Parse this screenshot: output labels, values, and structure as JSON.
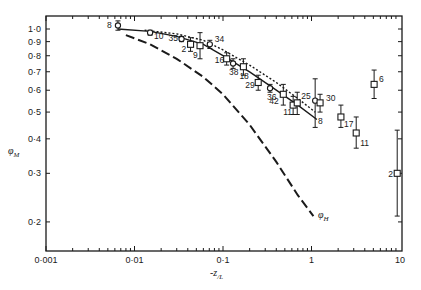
{
  "chart_data": {
    "type": "scatter",
    "title": "",
    "xlabel": "-z/L",
    "ylabel": "φM",
    "xscale": "log",
    "yscale": "log",
    "xlim": [
      0.001,
      10
    ],
    "ylim": [
      0.15,
      1.1
    ],
    "grid": false,
    "x_ticks": [
      0.001,
      0.01,
      0.1,
      1,
      10
    ],
    "x_tick_labels": [
      "0·001",
      "0·01",
      "0·1",
      "1",
      "10"
    ],
    "y_ticks": [
      1.0,
      0.9,
      0.8,
      0.7,
      0.6,
      0.5,
      0.4,
      0.3,
      0.2
    ],
    "y_tick_labels": [
      "1·0",
      "0·9",
      "0·8",
      "0·7",
      "0·6",
      "0·5",
      "0·4",
      "0·3",
      "0·2"
    ],
    "series": [
      {
        "name": "observations (circles)",
        "marker": "circle",
        "points": [
          {
            "x": 0.0065,
            "y": 1.03,
            "label": "8",
            "err": [
              0.99,
              1.07
            ]
          },
          {
            "x": 0.015,
            "y": 0.97,
            "label": "10",
            "err": [
              0.95,
              0.99
            ]
          },
          {
            "x": 0.034,
            "y": 0.92,
            "label": "35",
            "err": [
              0.9,
              0.94
            ]
          },
          {
            "x": 0.071,
            "y": 0.88,
            "label": "34",
            "err": [
              0.85,
              0.91
            ]
          },
          {
            "x": 0.13,
            "y": 0.75,
            "label": "38",
            "err": [
              0.72,
              0.78
            ]
          },
          {
            "x": 0.34,
            "y": 0.61,
            "label": "36",
            "err": [
              0.59,
              0.63
            ]
          },
          {
            "x": 1.1,
            "y": 0.55,
            "label": "",
            "err": [
              0.44,
              0.66
            ]
          }
        ]
      },
      {
        "name": "observations (squares)",
        "marker": "square",
        "points": [
          {
            "x": 0.043,
            "y": 0.88,
            "label": "2",
            "err": [
              0.83,
              0.93
            ]
          },
          {
            "x": 0.055,
            "y": 0.87,
            "label": "9",
            "err": [
              0.78,
              0.97
            ]
          },
          {
            "x": 0.11,
            "y": 0.78,
            "label": "16",
            "err": [
              0.74,
              0.82
            ]
          },
          {
            "x": 0.17,
            "y": 0.73,
            "label": "18",
            "err": [
              0.68,
              0.78
            ]
          },
          {
            "x": 0.25,
            "y": 0.64,
            "label": "29",
            "err": [
              0.6,
              0.68
            ]
          },
          {
            "x": 0.48,
            "y": 0.58,
            "label": "42",
            "err": [
              0.53,
              0.63
            ]
          },
          {
            "x": 0.62,
            "y": 0.53,
            "label": "11",
            "err": [
              0.49,
              0.57
            ]
          },
          {
            "x": 0.69,
            "y": 0.54,
            "label": "25",
            "err": [
              0.49,
              0.59
            ]
          },
          {
            "x": 1.25,
            "y": 0.54,
            "label": "30",
            "err": [
              0.5,
              0.58
            ]
          },
          {
            "x": 2.15,
            "y": 0.48,
            "label": "17",
            "err": [
              0.44,
              0.53
            ]
          },
          {
            "x": 3.2,
            "y": 0.42,
            "label": "11",
            "err": [
              0.37,
              0.48
            ]
          },
          {
            "x": 5.1,
            "y": 0.63,
            "label": "6",
            "err": [
              0.56,
              0.71
            ]
          },
          {
            "x": 9.3,
            "y": 0.3,
            "label": "2",
            "err": [
              0.21,
              0.43
            ]
          }
        ]
      },
      {
        "name": "solid curve",
        "style": "solid",
        "label": "8",
        "points": [
          [
            0.0065,
            1.0
          ],
          [
            0.015,
            0.98
          ],
          [
            0.03,
            0.94
          ],
          [
            0.06,
            0.88
          ],
          [
            0.1,
            0.8
          ],
          [
            0.2,
            0.7
          ],
          [
            0.4,
            0.6
          ],
          [
            0.7,
            0.53
          ],
          [
            1.15,
            0.47
          ]
        ]
      },
      {
        "name": "dotted curve",
        "style": "dotted",
        "points": [
          [
            0.013,
            0.99
          ],
          [
            0.03,
            0.96
          ],
          [
            0.06,
            0.91
          ],
          [
            0.1,
            0.84
          ],
          [
            0.2,
            0.74
          ],
          [
            0.4,
            0.64
          ],
          [
            0.7,
            0.56
          ],
          [
            1.1,
            0.5
          ]
        ]
      },
      {
        "name": "φH",
        "style": "long-dash",
        "label": "φH",
        "points": [
          [
            0.008,
            0.95
          ],
          [
            0.015,
            0.88
          ],
          [
            0.03,
            0.78
          ],
          [
            0.06,
            0.67
          ],
          [
            0.1,
            0.58
          ],
          [
            0.2,
            0.45
          ],
          [
            0.4,
            0.33
          ],
          [
            0.7,
            0.25
          ],
          [
            1.05,
            0.21
          ]
        ]
      }
    ]
  },
  "axes": {
    "x_title_main": "-z",
    "x_title_sub": "/L",
    "y_title_main": "φ",
    "y_title_sub": "M",
    "curve_label_phiH_main": "φ",
    "curve_label_phiH_sub": "H",
    "curve_label_solid": "8"
  }
}
